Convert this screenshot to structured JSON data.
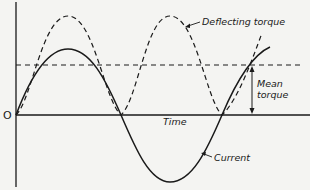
{
  "diagram": {
    "title": "",
    "origin_label": "O",
    "x_axis_label": "Time",
    "labels": {
      "deflecting_torque": "Deflecting torque",
      "mean_torque_line1": "Mean",
      "mean_torque_line2": "torque",
      "current": "Current"
    },
    "curves": [
      {
        "name": "Current",
        "style": "solid",
        "shape": "sine"
      },
      {
        "name": "Deflecting torque",
        "style": "dashed",
        "shape": "sine-squared"
      },
      {
        "name": "Mean torque",
        "style": "dashed",
        "shape": "horizontal line at half of torque peak"
      }
    ],
    "colors": {
      "ink": "#1a1a1a",
      "paper": "#f4f4f2"
    }
  }
}
